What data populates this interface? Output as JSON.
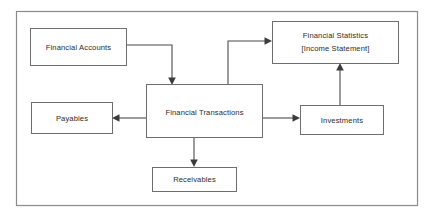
{
  "diagram": {
    "type": "flowchart",
    "frame": {
      "label": "diagram-frame"
    },
    "nodes": [
      {
        "id": "financial-accounts",
        "lines": [
          "Financial Accounts"
        ],
        "x": 30,
        "y": 28,
        "w": 96,
        "h": 37
      },
      {
        "id": "financial-statistics",
        "lines": [
          "Financial Statistics",
          "[Income Statement]"
        ],
        "x": 272,
        "y": 21,
        "w": 126,
        "h": 42
      },
      {
        "id": "financial-transactions",
        "lines": [
          "Financial Transactions"
        ],
        "x": 146,
        "y": 84,
        "w": 116,
        "h": 53
      },
      {
        "id": "payables",
        "lines": [
          "Payables"
        ],
        "x": 31,
        "y": 102,
        "w": 81,
        "h": 31
      },
      {
        "id": "investments",
        "lines": [
          "Investments"
        ],
        "x": 300,
        "y": 105,
        "w": 83,
        "h": 29
      },
      {
        "id": "receivables",
        "lines": [
          "Receivables"
        ],
        "x": 152,
        "y": 167,
        "w": 84,
        "h": 24
      }
    ],
    "edges": [
      {
        "id": "accounts-to-transactions",
        "from": "financial-accounts",
        "to": "financial-transactions"
      },
      {
        "id": "transactions-to-statistics",
        "from": "financial-transactions",
        "to": "financial-statistics"
      },
      {
        "id": "transactions-to-payables",
        "from": "financial-transactions",
        "to": "payables"
      },
      {
        "id": "transactions-to-investments",
        "from": "financial-transactions",
        "to": "investments"
      },
      {
        "id": "transactions-to-receivables",
        "from": "financial-transactions",
        "to": "receivables"
      },
      {
        "id": "investments-to-statistics",
        "from": "investments",
        "to": "financial-statistics"
      }
    ],
    "colors": {
      "background": "#ffffff",
      "box_stroke": "#6d6d6d",
      "frame_stroke": "#8a8a8a",
      "connector": "#4a4a4a",
      "text": "#2b2b2b"
    }
  }
}
